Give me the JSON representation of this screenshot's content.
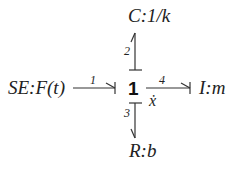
{
  "diagram": {
    "type": "bond-graph",
    "junction": {
      "label": "1",
      "annotation": "ẋ"
    },
    "elements": {
      "capacitor": {
        "label": "C:1/k"
      },
      "source": {
        "label": "SE:F(t)"
      },
      "inertia": {
        "label": "I:m"
      },
      "resistor": {
        "label": "R:b"
      }
    },
    "bonds": [
      {
        "number": "1",
        "from": "SE:F(t)",
        "to": "1"
      },
      {
        "number": "2",
        "from": "1",
        "to": "C:1/k"
      },
      {
        "number": "3",
        "from": "1",
        "to": "R:b"
      },
      {
        "number": "4",
        "from": "1",
        "to": "I:m"
      }
    ],
    "stroke_color": "#333333"
  }
}
